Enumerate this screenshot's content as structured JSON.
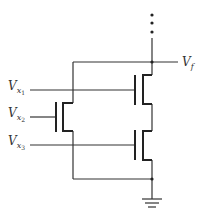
{
  "diagram": {
    "type": "NMOS pull-down network",
    "labels": {
      "output": {
        "main": "V",
        "sub": "f"
      },
      "input1": {
        "main": "V",
        "sub": "x",
        "subsub": "1"
      },
      "input2": {
        "main": "V",
        "sub": "x",
        "subsub": "2"
      },
      "input3": {
        "main": "V",
        "sub": "x",
        "subsub": "3"
      }
    },
    "colors": {
      "wire": "#333333",
      "background": "#ffffff"
    }
  }
}
